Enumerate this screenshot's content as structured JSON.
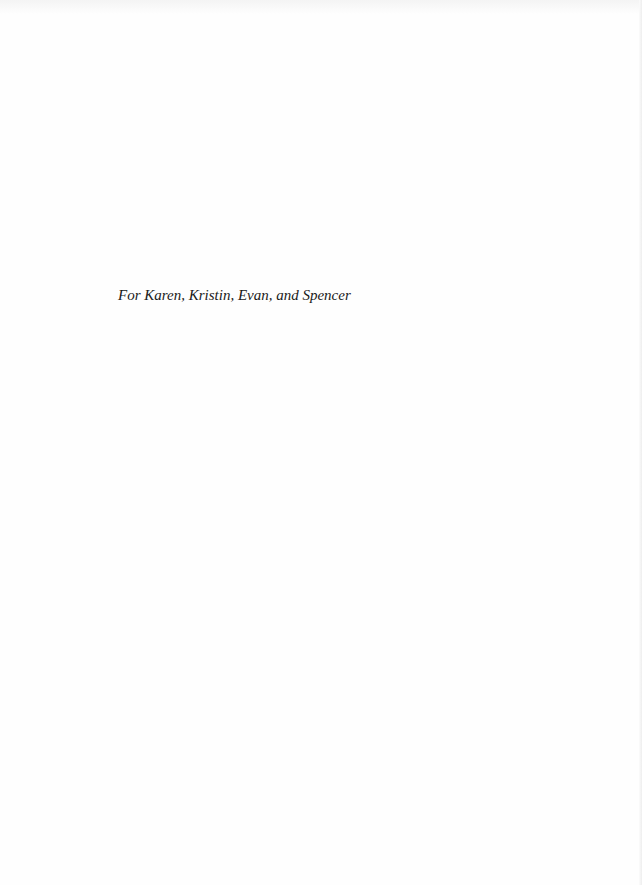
{
  "document": {
    "type": "dedication-page",
    "dedication": "For Karen, Kristin, Evan, and Spencer"
  }
}
